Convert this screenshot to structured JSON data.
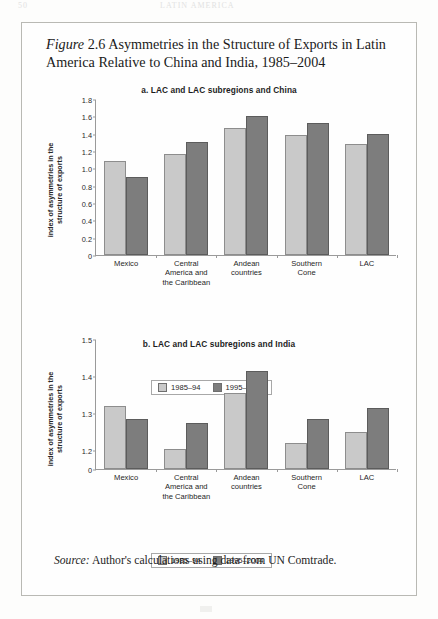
{
  "running_head": {
    "folio": "50",
    "title": "LATIN AMERICA"
  },
  "figure": {
    "label": "Figure",
    "number": "2.6",
    "title": "Asymmetries in the Structure of Exports in Latin America Relative to China and India, 1985–2004",
    "source_label": "Source:",
    "source_text": "Author's calculations using data from UN Comtrade."
  },
  "legend": {
    "series_1": "1985–94",
    "series_2": "1995–2004"
  },
  "colors": {
    "series_1": "#c9c9c9",
    "series_2": "#7d7d7d",
    "axis": "#9a9a9a",
    "box_border": "#b9b9b4",
    "text": "#1d1d1d"
  },
  "chart_data": [
    {
      "id": "chart-a",
      "type": "bar",
      "title": "a. LAC and LAC subregions and China",
      "ylabel": "index of asymmetries in the\nstructure of exports",
      "ylabel_line1": "index of asymmetries in the",
      "ylabel_line2": "structure of exports",
      "xlabel": "",
      "categories": [
        "Mexico",
        "Central\nAmerica and\nthe Caribbean",
        "Andean\ncountries",
        "Southern\nCone",
        "LAC"
      ],
      "series": [
        {
          "name": "1985–94",
          "values": [
            1.09,
            1.16,
            1.47,
            1.38,
            1.28
          ]
        },
        {
          "name": "1995–2004",
          "values": [
            0.9,
            1.3,
            1.6,
            1.52,
            1.4
          ]
        }
      ],
      "ylim": [
        0,
        1.8
      ],
      "yticks": [
        0,
        0.2,
        0.4,
        0.6,
        0.8,
        1.0,
        1.2,
        1.4,
        1.6,
        1.8
      ],
      "ytick_labels": [
        "0",
        "0.2",
        "0.4",
        "0.6",
        "0.8",
        "1.0",
        "1.2",
        "1.4",
        "1.6",
        "1.8"
      ],
      "grid": false,
      "broken_axis": false,
      "legend_position": "bottom-center"
    },
    {
      "id": "chart-b",
      "type": "bar",
      "title": "b. LAC and LAC subregions and India",
      "ylabel": "index of asymmetries in the\nstructure of exports",
      "ylabel_line1": "index of asymmetries in the",
      "ylabel_line2": "structure of exports",
      "xlabel": "",
      "categories": [
        "Mexico",
        "Central\nAmerica and\nthe Caribbean",
        "Andean\ncountries",
        "Southern\nCone",
        "LAC"
      ],
      "series": [
        {
          "name": "1985–94",
          "values": [
            1.32,
            1.205,
            1.355,
            1.22,
            1.25
          ]
        },
        {
          "name": "1995–2004",
          "values": [
            1.285,
            1.275,
            1.415,
            1.285,
            1.315
          ]
        }
      ],
      "ylim": [
        1.15,
        1.5
      ],
      "yticks": [
        1.2,
        1.3,
        1.4,
        1.5
      ],
      "ytick_labels": [
        "1.2",
        "1.3",
        "1.4",
        "1.5"
      ],
      "zero_tick_label": "0",
      "grid": false,
      "broken_axis": true,
      "legend_position": "bottom-center"
    }
  ]
}
